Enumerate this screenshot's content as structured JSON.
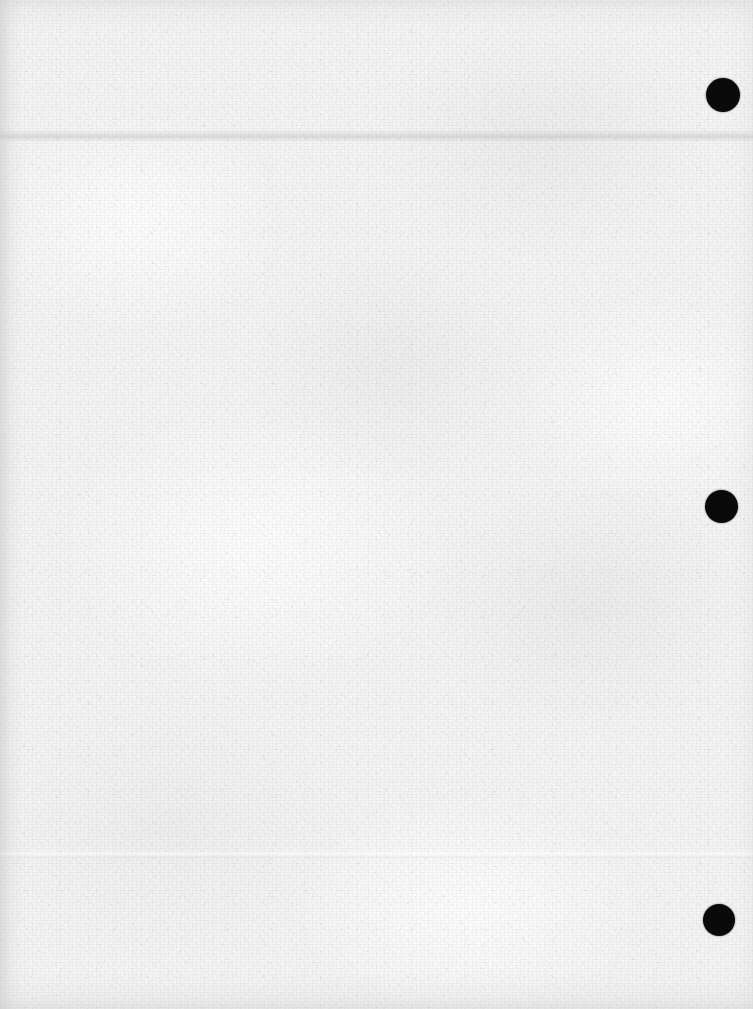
{
  "page": {
    "kind": "scanned-blank-sheet",
    "width": 753,
    "height": 1009,
    "orientation": "portrait",
    "content_text": "",
    "background_color": "#f6f6f6",
    "paper_tone_light": "#fafafa",
    "paper_tone_dark": "#e9e9e9"
  },
  "marks": {
    "punch_holes": [
      {
        "name": "punch-hole-top",
        "color": "#0a0a0a",
        "center_x": 723,
        "center_y": 95,
        "diameter": 34
      },
      {
        "name": "punch-hole-middle",
        "color": "#0a0a0a",
        "center_x": 721,
        "center_y": 506,
        "diameter": 33
      },
      {
        "name": "punch-hole-bottom",
        "color": "#0a0a0a",
        "center_x": 719,
        "center_y": 920,
        "diameter": 32
      }
    ],
    "creases": [
      {
        "name": "crease-top",
        "y": 136,
        "orientation": "horizontal",
        "color": "#bcbcbc"
      },
      {
        "name": "crease-lower",
        "y": 855,
        "orientation": "horizontal",
        "color": "#cccccc"
      }
    ],
    "binding_band": {
      "name": "binding-shadow-left",
      "x": 0,
      "width": 16,
      "color": "#c4c4c4"
    }
  }
}
